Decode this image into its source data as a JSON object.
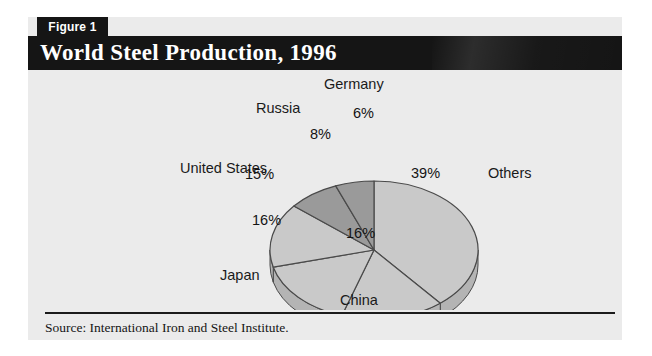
{
  "figure": {
    "number_label": "Figure 1",
    "title": "World Steel Production, 1996",
    "source": "Source: International Iron and Steel Institute."
  },
  "colors": {
    "panel_background": "#ebebeb",
    "title_bar": "#151515",
    "title_text": "#ffffff",
    "slice_light": "#c9c9c9",
    "slice_dark": "#9a9a9a",
    "slice_outline": "#4a4a4a",
    "side_light": "#b4b4b4",
    "side_dark": "#8a8a8a",
    "rule": "#1b1b1b"
  },
  "chart_data": {
    "type": "pie",
    "title": "World Steel Production, 1996",
    "subtitle": "",
    "xlabel": "",
    "ylabel": "",
    "units": "percent of world steel production",
    "grid": false,
    "legend": "none",
    "label_placement": "outside category names with inside percent values",
    "three_d": true,
    "start_angle_deg": 0,
    "direction": "clockwise",
    "categories": [
      "Others",
      "China",
      "Japan",
      "United States",
      "Russia",
      "Germany"
    ],
    "values": [
      39,
      16,
      16,
      15,
      8,
      6
    ],
    "slices": [
      {
        "name": "Others",
        "value": 39,
        "value_label": "39%",
        "shade": "light"
      },
      {
        "name": "China",
        "value": 16,
        "value_label": "16%",
        "shade": "light"
      },
      {
        "name": "Japan",
        "value": 16,
        "value_label": "16%",
        "shade": "light"
      },
      {
        "name": "United States",
        "value": 15,
        "value_label": "15%",
        "shade": "light"
      },
      {
        "name": "Russia",
        "value": 8,
        "value_label": "8%",
        "shade": "dark"
      },
      {
        "name": "Germany",
        "value": 6,
        "value_label": "6%",
        "shade": "dark"
      }
    ],
    "total": 100
  }
}
